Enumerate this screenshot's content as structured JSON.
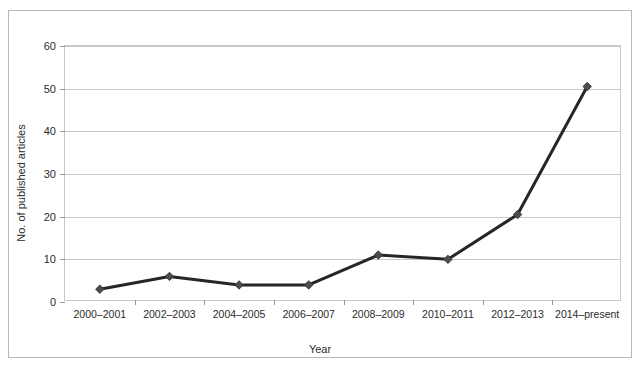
{
  "chart_data": {
    "type": "line",
    "title": "",
    "xlabel": "Year",
    "ylabel": "No. of published articles",
    "categories": [
      "2000–2001",
      "2002–2003",
      "2004–2005",
      "2006–2007",
      "2008–2009",
      "2010–2011",
      "2012–2013",
      "2014–present"
    ],
    "values": [
      3,
      6,
      4,
      4,
      11,
      10,
      20.5,
      50.5
    ],
    "ylim": [
      0,
      60
    ],
    "yticks": [
      0,
      10,
      20,
      30,
      40,
      50,
      60
    ],
    "ytick_labels": [
      "0",
      "10",
      "20",
      "30",
      "40",
      "50",
      "60"
    ],
    "grid": true,
    "legend": "none",
    "marker": "diamond",
    "line_color": "#262626",
    "marker_color": "#4d4d4d",
    "grid_color": "#c9c9c9"
  }
}
